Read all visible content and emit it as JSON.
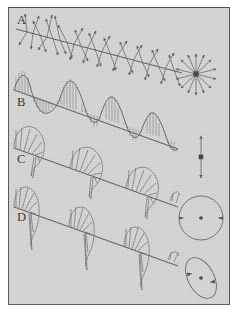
{
  "figure": {
    "panel_background_color": "#d2d2d0",
    "page_background_color": "#ffffff",
    "ink_color": "#555555",
    "border_color": "#4a4a4a",
    "frame": {
      "x": 8,
      "y": 7,
      "width": 222,
      "height": 298
    }
  },
  "panels": [
    {
      "id": "A",
      "label": "A",
      "label_x": 17,
      "label_y": 24,
      "name": "unpolarized-light",
      "description": "Unpolarized light: randomly oriented transverse vector arrows along the propagation axis",
      "axis": {
        "x1": 16,
        "y1": 28,
        "x2": 180,
        "y2": 72
      },
      "arrow_count": 34,
      "end_view": "starburst"
    },
    {
      "id": "B",
      "label": "B",
      "label_x": 17,
      "label_y": 106,
      "name": "linear-polarization",
      "description": "Plane (linear) polarized light: a single sinusoid confined to one plane with vertical hatching",
      "axis": {
        "x1": 14,
        "y1": 90,
        "x2": 176,
        "y2": 148
      },
      "cycles": 2.5,
      "amplitude": 22,
      "hatch_count": 34,
      "end_view": "double-arrow"
    },
    {
      "id": "C",
      "label": "C",
      "label_x": 17,
      "label_y": 163,
      "name": "circular-polarization",
      "description": "Circularly polarized light: helix drawn as semicircular fans of radial vectors",
      "axis": {
        "x1": 14,
        "y1": 148,
        "x2": 176,
        "y2": 206
      },
      "cycles": 2.5,
      "amplitude": 25,
      "fan_spokes": 7,
      "end_view": "circle"
    },
    {
      "id": "D",
      "label": "D",
      "label_x": 17,
      "label_y": 221,
      "name": "elliptical-polarization",
      "description": "Elliptically polarized light: skewed asymmetric fans of radial vectors",
      "axis": {
        "x1": 14,
        "y1": 206,
        "x2": 176,
        "y2": 264
      },
      "cycles": 2.5,
      "amplitude": 23,
      "fan_spokes": 6,
      "end_view": "ellipse"
    }
  ],
  "end_views": [
    {
      "id": "starburst",
      "name": "unpolarized-end-view",
      "for_panel": "A",
      "center": {
        "x": 196,
        "y": 74
      },
      "radius": 21,
      "ray_count": 15,
      "center_marker": "filled-square"
    },
    {
      "id": "double-arrow",
      "name": "linear-end-view",
      "for_panel": "B",
      "center": {
        "x": 201,
        "y": 157
      },
      "half_length": 22,
      "orientation": "vertical",
      "arrowheads": 2,
      "center_marker": "filled-square"
    },
    {
      "id": "circle",
      "name": "circular-end-view",
      "for_panel": "C",
      "center": {
        "x": 201,
        "y": 218
      },
      "radius": 22,
      "arrowheads": 2,
      "center_marker": "dot"
    },
    {
      "id": "ellipse",
      "name": "elliptical-end-view",
      "for_panel": "D",
      "center": {
        "x": 201,
        "y": 278
      },
      "radius_x": 13,
      "radius_y": 22,
      "rotation_deg": -28,
      "arrowheads": 2,
      "center_marker": "dot"
    }
  ]
}
